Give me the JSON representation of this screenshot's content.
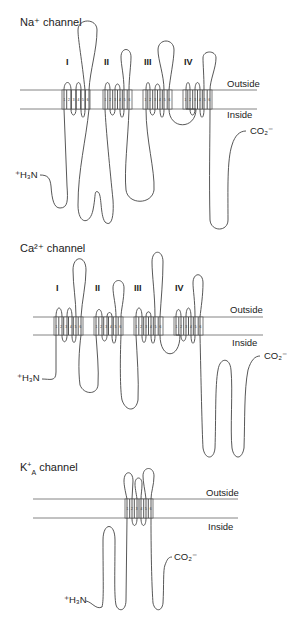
{
  "figure": {
    "panels": [
      {
        "id": "na",
        "title": "Na⁺ channel",
        "outside_label": "Outside",
        "inside_label": "Inside",
        "n_terminus_label": "⁺H₃N",
        "c_terminus_label": "CO₂⁻",
        "domains": [
          "I",
          "II",
          "III",
          "IV"
        ],
        "segments": [
          "1",
          "2",
          "3",
          "4",
          "5",
          "6"
        ]
      },
      {
        "id": "ca",
        "title": "Ca²⁺ channel",
        "outside_label": "Outside",
        "inside_label": "Inside",
        "n_terminus_label": "⁺H₃N",
        "c_terminus_label": "CO₂⁻",
        "domains": [
          "I",
          "II",
          "III",
          "IV"
        ],
        "segments": [
          "1",
          "2",
          "3",
          "4",
          "5",
          "6"
        ]
      },
      {
        "id": "ka",
        "title": "K⁺A channel",
        "title_main": "K",
        "title_sup": "+",
        "title_sub": "A",
        "title_rest": " channel",
        "outside_label": "Outside",
        "inside_label": "Inside",
        "n_terminus_label": "⁺H₃N",
        "c_terminus_label": "CO₂⁻",
        "domains": [],
        "segments": [
          "1",
          "2",
          "3",
          "4",
          "5",
          "6"
        ]
      }
    ]
  }
}
